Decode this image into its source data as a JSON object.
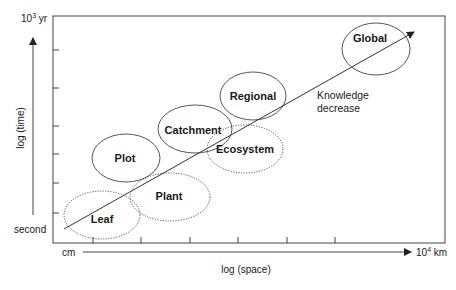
{
  "diagram": {
    "y_axis": {
      "label": "log (time)",
      "top_label_base": "10",
      "top_label_exp": "3",
      "top_label_unit": " yr",
      "bottom_label": "second"
    },
    "x_axis": {
      "label": "log (space)",
      "left_label": "cm",
      "right_label_base": "10",
      "right_label_exp": "4",
      "right_label_unit": " km"
    },
    "trend_annotation": {
      "line1": "Knowledge",
      "line2": "decrease"
    },
    "scales": [
      {
        "name": "Leaf",
        "style": "dotted"
      },
      {
        "name": "Plot",
        "style": "solid"
      },
      {
        "name": "Plant",
        "style": "dotted"
      },
      {
        "name": "Catchment",
        "style": "solid"
      },
      {
        "name": "Ecosystem",
        "style": "dotted"
      },
      {
        "name": "Regional",
        "style": "solid"
      },
      {
        "name": "Global",
        "style": "solid"
      }
    ],
    "colors": {
      "line": "#333333",
      "text": "#1a1a1a",
      "background": "#ffffff"
    }
  }
}
